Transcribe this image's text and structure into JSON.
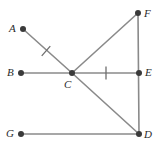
{
  "figure": {
    "type": "geometry-diagram",
    "width": 159,
    "height": 157,
    "background_color": "#ffffff",
    "line_color": "#8a8a8a",
    "point_color": "#3a3a3a",
    "tick_color": "#6e6e6e",
    "label_color": "#2b2b2b",
    "points": [
      {
        "id": "A",
        "label": "A",
        "x": 23,
        "y": 29,
        "label_x": 9,
        "label_y": 23
      },
      {
        "id": "B",
        "label": "B",
        "x": 21,
        "y": 73,
        "label_x": 7,
        "label_y": 67
      },
      {
        "id": "C",
        "label": "C",
        "x": 72,
        "y": 73,
        "label_x": 64,
        "label_y": 79
      },
      {
        "id": "D",
        "label": "D",
        "x": 139,
        "y": 134,
        "label_x": 144,
        "label_y": 129
      },
      {
        "id": "E",
        "label": "E",
        "x": 139,
        "y": 73,
        "label_x": 145,
        "label_y": 67
      },
      {
        "id": "F",
        "label": "F",
        "x": 138,
        "y": 13,
        "label_x": 144,
        "label_y": 8
      },
      {
        "id": "G",
        "label": "G",
        "x": 21,
        "y": 134,
        "label_x": 6,
        "label_y": 128
      }
    ],
    "segments": [
      {
        "id": "AC",
        "from": "A",
        "to": "C"
      },
      {
        "id": "BE",
        "from": "B",
        "to": "E"
      },
      {
        "id": "CF",
        "from": "C",
        "to": "F"
      },
      {
        "id": "CD",
        "from": "C",
        "to": "D"
      },
      {
        "id": "FD",
        "from": "F",
        "to": "D"
      },
      {
        "id": "GD",
        "from": "G",
        "to": "D"
      }
    ],
    "tick_marks": [
      {
        "id": "tick-on-AC",
        "on_segment": "AC",
        "x": 46,
        "y": 51,
        "angle_deg": 41
      },
      {
        "id": "tick-on-CE",
        "on_segment": "CE",
        "x": 106,
        "y": 73,
        "angle_deg": 0
      }
    ]
  }
}
